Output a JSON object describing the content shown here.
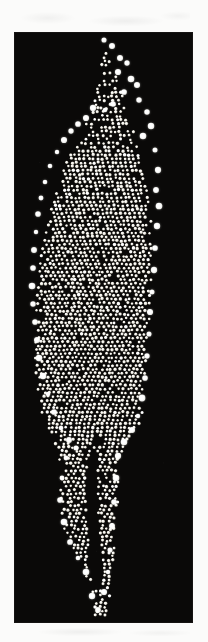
{
  "figure": {
    "domain": "natural-image",
    "caption": "",
    "canvas": {
      "width": 208,
      "height": 642
    },
    "page_background": "#fbfbfa",
    "margin_smudges_visible": true
  },
  "image_panel": {
    "label": "",
    "x": 15,
    "y": 33,
    "width": 177,
    "height": 589,
    "background_color": "#0a0908",
    "border_color": "#151312",
    "particle_color": "#ffffff",
    "particle_rim_color": "#f2f0e8"
  },
  "structure": {
    "name": "dendritic-columnar-aggregate",
    "description": "Inverted flame / tree shaped packing of monodisperse spheres: thin branching filaments at the top, a broad dense bulbous body in the middle, and two narrow tapering tails at the bottom separated by a dark channel.",
    "particle_diameter_px": 3.1,
    "lattice_pitch_px": 4.5,
    "lattice_type": "quasi-hexagonal",
    "jitter_px": 0.9,
    "approx_particle_count": 4200,
    "regions": [
      {
        "name": "top-filaments",
        "y_start": 40,
        "y_end": 150,
        "fill": "sparse-branched"
      },
      {
        "name": "dense-body",
        "y_start": 150,
        "y_end": 440,
        "fill": "dense-packed"
      },
      {
        "name": "left-tail",
        "y_start": 440,
        "y_end": 560,
        "fill": "medium"
      },
      {
        "name": "right-tail",
        "y_start": 440,
        "y_end": 620,
        "fill": "medium"
      }
    ],
    "outline_left": [
      [
        104,
        38
      ],
      [
        101,
        60
      ],
      [
        96,
        84
      ],
      [
        90,
        104
      ],
      [
        84,
        118
      ],
      [
        79,
        132
      ],
      [
        72,
        150
      ],
      [
        64,
        172
      ],
      [
        56,
        196
      ],
      [
        48,
        224
      ],
      [
        42,
        256
      ],
      [
        38,
        292
      ],
      [
        36,
        326
      ],
      [
        36,
        360
      ],
      [
        38,
        392
      ],
      [
        44,
        418
      ],
      [
        52,
        436
      ],
      [
        58,
        450
      ],
      [
        60,
        470
      ],
      [
        60,
        492
      ],
      [
        62,
        514
      ],
      [
        66,
        534
      ],
      [
        72,
        552
      ],
      [
        78,
        562
      ],
      [
        84,
        570
      ],
      [
        90,
        582
      ],
      [
        94,
        600
      ],
      [
        96,
        614
      ]
    ],
    "outline_right": [
      [
        104,
        38
      ],
      [
        110,
        56
      ],
      [
        116,
        76
      ],
      [
        122,
        94
      ],
      [
        128,
        112
      ],
      [
        134,
        132
      ],
      [
        140,
        154
      ],
      [
        146,
        180
      ],
      [
        150,
        210
      ],
      [
        152,
        244
      ],
      [
        152,
        280
      ],
      [
        150,
        314
      ],
      [
        148,
        348
      ],
      [
        146,
        380
      ],
      [
        144,
        404
      ],
      [
        140,
        424
      ],
      [
        132,
        438
      ],
      [
        124,
        448
      ],
      [
        120,
        466
      ],
      [
        118,
        492
      ],
      [
        116,
        520
      ],
      [
        114,
        548
      ],
      [
        112,
        572
      ],
      [
        110,
        594
      ],
      [
        108,
        612
      ],
      [
        104,
        618
      ]
    ],
    "interior_gap": {
      "name": "central-dark-channel",
      "points": [
        [
          94,
          452
        ],
        [
          92,
          480
        ],
        [
          92,
          510
        ],
        [
          94,
          540
        ],
        [
          96,
          566
        ],
        [
          98,
          588
        ]
      ],
      "half_width_px": 5.5
    },
    "bright_rim_particles": [
      [
        104,
        40
      ],
      [
        112,
        46
      ],
      [
        120,
        58
      ],
      [
        127,
        63
      ],
      [
        118,
        72
      ],
      [
        131,
        79
      ],
      [
        137,
        85
      ],
      [
        124,
        92
      ],
      [
        139,
        100
      ],
      [
        113,
        104
      ],
      [
        105,
        110
      ],
      [
        93,
        108
      ],
      [
        86,
        118
      ],
      [
        78,
        124
      ],
      [
        71,
        131
      ],
      [
        64,
        140
      ],
      [
        147,
        112
      ],
      [
        151,
        126
      ],
      [
        143,
        136
      ],
      [
        57,
        152
      ],
      [
        50,
        166
      ],
      [
        155,
        150
      ],
      [
        45,
        182
      ],
      [
        41,
        198
      ],
      [
        158,
        170
      ],
      [
        156,
        190
      ],
      [
        38,
        214
      ],
      [
        36,
        232
      ],
      [
        159,
        206
      ],
      [
        34,
        250
      ],
      [
        33,
        268
      ],
      [
        157,
        226
      ],
      [
        155,
        248
      ],
      [
        32,
        286
      ],
      [
        33,
        304
      ],
      [
        154,
        270
      ],
      [
        35,
        322
      ],
      [
        37,
        340
      ],
      [
        152,
        292
      ],
      [
        150,
        312
      ],
      [
        39,
        358
      ],
      [
        43,
        376
      ],
      [
        149,
        334
      ],
      [
        147,
        356
      ],
      [
        48,
        394
      ],
      [
        54,
        412
      ],
      [
        145,
        378
      ],
      [
        142,
        398
      ],
      [
        61,
        428
      ],
      [
        69,
        440
      ],
      [
        138,
        416
      ],
      [
        132,
        430
      ],
      [
        76,
        448
      ],
      [
        66,
        458
      ],
      [
        124,
        442
      ],
      [
        118,
        456
      ],
      [
        62,
        478
      ],
      [
        60,
        500
      ],
      [
        116,
        478
      ],
      [
        114,
        502
      ],
      [
        64,
        522
      ],
      [
        70,
        542
      ],
      [
        112,
        526
      ],
      [
        110,
        550
      ],
      [
        78,
        558
      ],
      [
        86,
        572
      ],
      [
        108,
        572
      ],
      [
        104,
        592
      ],
      [
        92,
        596
      ],
      [
        98,
        610
      ]
    ]
  }
}
